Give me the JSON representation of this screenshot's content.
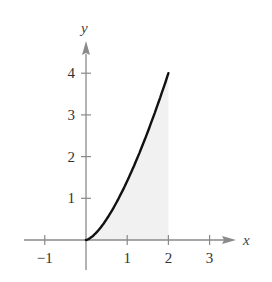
{
  "chart_data": {
    "type": "area",
    "title": "",
    "xlabel": "x",
    "ylabel": "y",
    "xlim": [
      -1.2,
      3.5
    ],
    "ylim": [
      0,
      4.5
    ],
    "x_ticks": [
      -1,
      1,
      2,
      3
    ],
    "x_tick_labels": [
      "−1",
      "1",
      "2",
      "3"
    ],
    "y_ticks": [
      1,
      2,
      3,
      4
    ],
    "y_tick_labels": [
      "1",
      "2",
      "3",
      "4"
    ],
    "grid": false,
    "legend": null,
    "series": [
      {
        "name": "curve",
        "equation_estimate": "y = sqrt(2) * x^(3/2)",
        "x": [
          0,
          0.25,
          0.5,
          0.75,
          1,
          1.25,
          1.5,
          1.75,
          2
        ],
        "y": [
          0,
          0.18,
          0.5,
          0.92,
          1.41,
          1.98,
          2.6,
          3.27,
          4
        ]
      }
    ],
    "shaded_region": {
      "from_x": 0,
      "to_x": 2,
      "description": "region under curve between x=0 and x=2"
    },
    "colors": {
      "axis": "#8a8a8a",
      "curve": "#111111",
      "shade": "#f1f1f1"
    }
  }
}
